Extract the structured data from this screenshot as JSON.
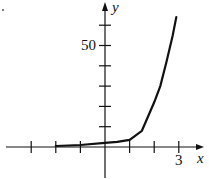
{
  "chart_data": {
    "type": "line",
    "title": "",
    "xlabel": "x",
    "ylabel": "y",
    "x_tick_labels": [
      {
        "value": 3,
        "label": "3"
      }
    ],
    "y_tick_labels": [
      {
        "value": 50,
        "label": "50"
      }
    ],
    "x_ticks": [
      -3,
      -2,
      -1,
      1,
      2,
      3
    ],
    "y_ticks": [
      10,
      20,
      30,
      40,
      50,
      60
    ],
    "xlim": [
      -4.2,
      4.1
    ],
    "ylim": [
      -15,
      72
    ],
    "grid": false,
    "legend": null,
    "series": [
      {
        "name": "curve",
        "x": [
          -2,
          -1,
          0,
          0.5,
          1,
          1.5,
          2,
          2.25,
          2.5,
          2.75,
          2.9
        ],
        "y": [
          0.5,
          1,
          2,
          2.5,
          3.5,
          8,
          22,
          30,
          42,
          55,
          64
        ]
      }
    ]
  },
  "labels": {
    "x_axis": "x",
    "y_axis": "y",
    "y_tick_50": "50",
    "x_tick_3": "3"
  }
}
